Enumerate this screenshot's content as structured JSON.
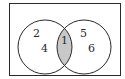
{
  "diagram": {
    "type": "venn",
    "universal_set": {
      "label": ""
    },
    "sets": [
      {
        "name": "left",
        "only_elements": [
          "2",
          "4"
        ]
      },
      {
        "name": "right",
        "only_elements": [
          "5",
          "6"
        ]
      }
    ],
    "intersection": {
      "elements": [
        "1"
      ],
      "shaded": true
    },
    "colors": {
      "stroke": "#2a2a2a",
      "shade": "#c8c8c8",
      "background": "#ffffff"
    }
  }
}
